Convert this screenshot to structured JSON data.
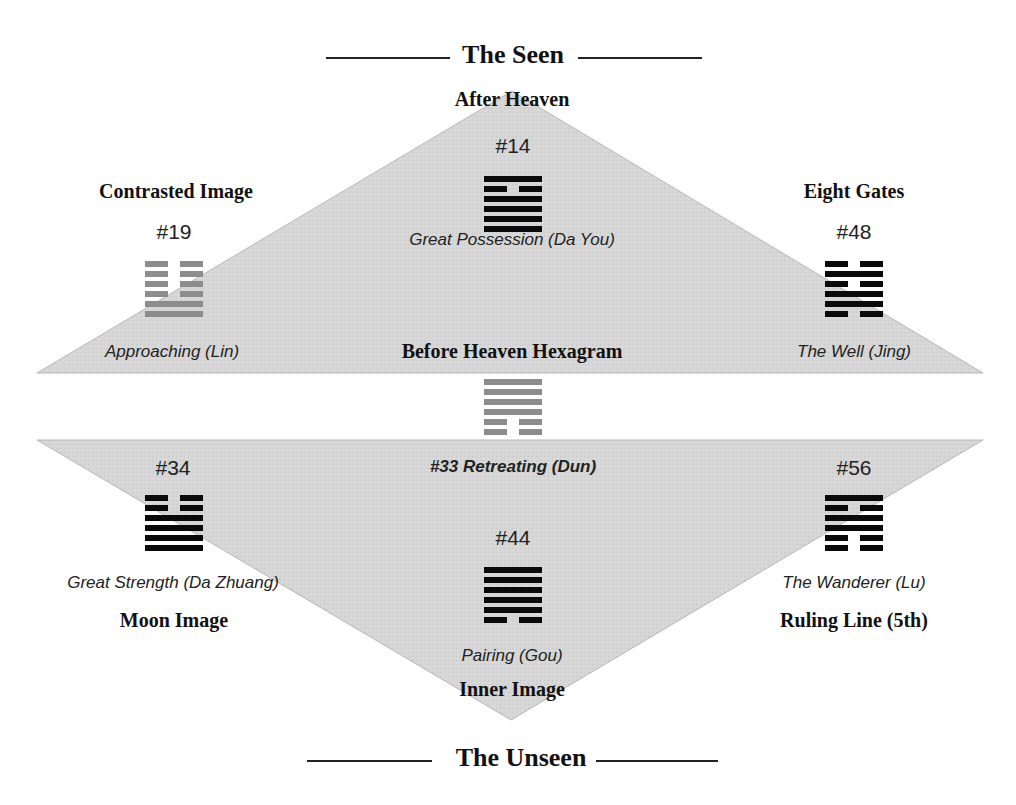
{
  "header": {
    "title": "The Seen"
  },
  "footer": {
    "title": "The Unseen"
  },
  "colors": {
    "triangle_fill": "#d4d4d4",
    "hex_black": "#0a0a0a",
    "hex_gray": "#8c8c8c"
  },
  "nodes": {
    "after_heaven": {
      "label": "After Heaven",
      "number": "#14",
      "name": "Great Possession (Da You)",
      "lines": [
        "solid",
        "broken",
        "solid",
        "solid",
        "solid",
        "solid"
      ],
      "color": "black"
    },
    "contrasted": {
      "label": "Contrasted Image",
      "number": "#19",
      "name": "Approaching (Lin)",
      "lines": [
        "broken",
        "broken",
        "broken",
        "broken",
        "solid",
        "solid"
      ],
      "color": "gray"
    },
    "eight_gates": {
      "label": "Eight Gates",
      "number": "#48",
      "name": "The Well (Jing)",
      "lines": [
        "broken",
        "solid",
        "broken",
        "solid",
        "solid",
        "broken"
      ],
      "color": "black"
    },
    "before_heaven": {
      "label": "Before Heaven Hexagram",
      "name": "#33 Retreating (Dun)",
      "lines": [
        "solid",
        "solid",
        "solid",
        "solid",
        "broken",
        "broken"
      ],
      "color": "gray"
    },
    "moon": {
      "label": "Moon Image",
      "number": "#34",
      "name": "Great Strength (Da Zhuang)",
      "lines": [
        "broken",
        "broken",
        "solid",
        "solid",
        "solid",
        "solid"
      ],
      "color": "black"
    },
    "ruling": {
      "label": "Ruling Line (5th)",
      "number": "#56",
      "name": "The Wanderer (Lu)",
      "lines": [
        "solid",
        "broken",
        "solid",
        "solid",
        "broken",
        "broken"
      ],
      "color": "black"
    },
    "inner": {
      "label": "Inner Image",
      "number": "#44",
      "name": "Pairing (Gou)",
      "lines": [
        "solid",
        "solid",
        "solid",
        "solid",
        "solid",
        "broken"
      ],
      "color": "black"
    }
  }
}
